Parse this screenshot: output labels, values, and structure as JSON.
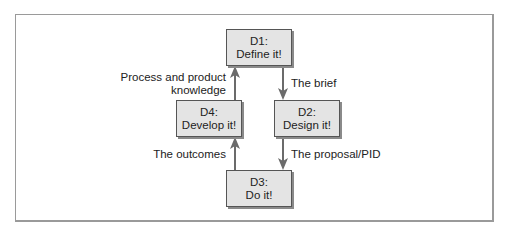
{
  "diagram": {
    "nodes": [
      {
        "id": "D1",
        "line1": "D1:",
        "line2": "Define it!"
      },
      {
        "id": "D2",
        "line1": "D2:",
        "line2": "Design it!"
      },
      {
        "id": "D3",
        "line1": "D3:",
        "line2": "Do it!"
      },
      {
        "id": "D4",
        "line1": "D4:",
        "line2": "Develop it!"
      }
    ],
    "edges": [
      {
        "from": "D1",
        "to": "D2",
        "label": "The brief"
      },
      {
        "from": "D2",
        "to": "D3",
        "label": "The proposal/PID"
      },
      {
        "from": "D3",
        "to": "D4",
        "label": "The outcomes"
      },
      {
        "from": "D4",
        "to": "D1",
        "label_line1": "Process and product",
        "label_line2": "knowledge"
      }
    ],
    "colors": {
      "box_fill": "#e4e4e4",
      "arrow": "#6b6b6b",
      "frame": "#9a9a9a"
    }
  }
}
